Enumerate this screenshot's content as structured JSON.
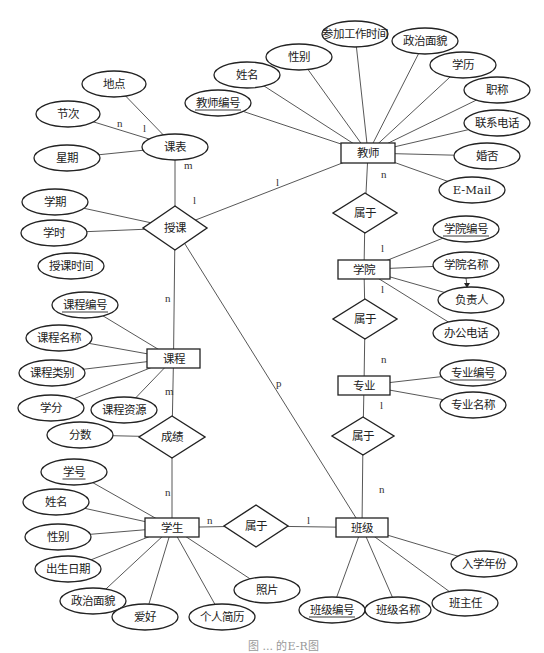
{
  "diagram": {
    "type": "E-R diagram",
    "caption": "图 ... 的E-R图",
    "entities": [
      {
        "id": "teacher",
        "label": "教师",
        "x": 341,
        "y": 143,
        "w": 54,
        "h": 20
      },
      {
        "id": "college",
        "label": "学院",
        "x": 338,
        "y": 260,
        "w": 52,
        "h": 19
      },
      {
        "id": "major",
        "label": "专业",
        "x": 338,
        "y": 376,
        "w": 52,
        "h": 19
      },
      {
        "id": "class",
        "label": "班级",
        "x": 336,
        "y": 518,
        "w": 52,
        "h": 19
      },
      {
        "id": "student",
        "label": "学生",
        "x": 145,
        "y": 518,
        "w": 54,
        "h": 19
      },
      {
        "id": "course",
        "label": "课程",
        "x": 147,
        "y": 349,
        "w": 53,
        "h": 19
      },
      {
        "id": "timetable",
        "label": "课表",
        "x": 175,
        "y": 147,
        "type": "ellipse",
        "rx": 33,
        "ry": 13
      }
    ],
    "relationships": [
      {
        "id": "teach",
        "label": "授课",
        "cx": 175,
        "cy": 228,
        "hw": 32,
        "hh": 22
      },
      {
        "id": "belong1",
        "label": "属于",
        "cx": 365,
        "cy": 213,
        "hw": 32,
        "hh": 20
      },
      {
        "id": "belong2",
        "label": "属于",
        "cx": 365,
        "cy": 319,
        "hw": 32,
        "hh": 20
      },
      {
        "id": "belong3",
        "label": "属于",
        "cx": 363,
        "cy": 436,
        "hw": 31,
        "hh": 19
      },
      {
        "id": "belong4",
        "label": "属于",
        "cx": 256,
        "cy": 526,
        "hw": 32,
        "hh": 21
      },
      {
        "id": "grade",
        "label": "成绩",
        "cx": 172,
        "cy": 437,
        "hw": 33,
        "hh": 21
      }
    ],
    "attributes": [
      {
        "label": "地点",
        "cx": 114,
        "cy": 84,
        "rx": 32,
        "ry": 13,
        "of": "timetable",
        "key": false
      },
      {
        "label": "节次",
        "cx": 68,
        "cy": 114,
        "rx": 32,
        "ry": 13,
        "of": "timetable",
        "key": false
      },
      {
        "label": "星期",
        "cx": 67,
        "cy": 158,
        "rx": 33,
        "ry": 13,
        "of": "timetable",
        "key": false
      },
      {
        "label": "学期",
        "cx": 55,
        "cy": 202,
        "rx": 33,
        "ry": 13,
        "of": "teach",
        "key": false
      },
      {
        "label": "学时",
        "cx": 54,
        "cy": 233,
        "rx": 33,
        "ry": 13,
        "of": "teach",
        "key": false
      },
      {
        "label": "授课时间",
        "cx": 71,
        "cy": 266,
        "rx": 33,
        "ry": 13,
        "of": null,
        "key": false
      },
      {
        "label": "课程编号",
        "cx": 85,
        "cy": 305,
        "rx": 33,
        "ry": 13,
        "of": "course",
        "key": true
      },
      {
        "label": "课程名称",
        "cx": 59,
        "cy": 338,
        "rx": 33,
        "ry": 13,
        "of": "course",
        "key": false
      },
      {
        "label": "课程类别",
        "cx": 52,
        "cy": 373,
        "rx": 33,
        "ry": 13,
        "of": "course",
        "key": false
      },
      {
        "label": "学分",
        "cx": 51,
        "cy": 408,
        "rx": 33,
        "ry": 13,
        "of": "course",
        "key": false
      },
      {
        "label": "课程资源",
        "cx": 124,
        "cy": 410,
        "rx": 33,
        "ry": 13,
        "of": "course",
        "key": false
      },
      {
        "label": "分数",
        "cx": 80,
        "cy": 435,
        "rx": 33,
        "ry": 13,
        "of": "grade",
        "key": false
      },
      {
        "label": "学号",
        "cx": 74,
        "cy": 472,
        "rx": 33,
        "ry": 13,
        "of": "student",
        "key": true
      },
      {
        "label": "姓名",
        "cx": 56,
        "cy": 502,
        "rx": 33,
        "ry": 13,
        "of": "student",
        "key": false
      },
      {
        "label": "性别",
        "cx": 58,
        "cy": 537,
        "rx": 33,
        "ry": 13,
        "of": "student",
        "key": false
      },
      {
        "label": "出生日期",
        "cx": 68,
        "cy": 569,
        "rx": 33,
        "ry": 13,
        "of": "student",
        "key": false
      },
      {
        "label": "政治面貌",
        "cx": 93,
        "cy": 601,
        "rx": 33,
        "ry": 13,
        "of": "student",
        "key": false
      },
      {
        "label": "爱好",
        "cx": 145,
        "cy": 617,
        "rx": 33,
        "ry": 13,
        "of": "student",
        "key": false
      },
      {
        "label": "个人简历",
        "cx": 222,
        "cy": 617,
        "rx": 33,
        "ry": 13,
        "of": "student",
        "key": false
      },
      {
        "label": "照片",
        "cx": 267,
        "cy": 590,
        "rx": 33,
        "ry": 13,
        "of": "student",
        "key": false
      },
      {
        "label": "班级编号",
        "cx": 332,
        "cy": 610,
        "rx": 33,
        "ry": 13,
        "of": "class",
        "key": true
      },
      {
        "label": "班级名称",
        "cx": 398,
        "cy": 610,
        "rx": 33,
        "ry": 13,
        "of": "class",
        "key": false
      },
      {
        "label": "班主任",
        "cx": 465,
        "cy": 603,
        "rx": 33,
        "ry": 13,
        "of": "class",
        "key": false
      },
      {
        "label": "入学年份",
        "cx": 484,
        "cy": 564,
        "rx": 33,
        "ry": 13,
        "of": "class",
        "key": false
      },
      {
        "label": "专业编号",
        "cx": 473,
        "cy": 373,
        "rx": 33,
        "ry": 13,
        "of": "major",
        "key": true
      },
      {
        "label": "专业名称",
        "cx": 473,
        "cy": 405,
        "rx": 33,
        "ry": 13,
        "of": "major",
        "key": false
      },
      {
        "label": "学院编号",
        "cx": 466,
        "cy": 229,
        "rx": 33,
        "ry": 13,
        "of": "college",
        "key": true
      },
      {
        "label": "学院名称",
        "cx": 466,
        "cy": 265,
        "rx": 33,
        "ry": 13,
        "of": "college",
        "key": false
      },
      {
        "label": "负责人",
        "cx": 471,
        "cy": 300,
        "rx": 33,
        "ry": 13,
        "of": "college",
        "key": false
      },
      {
        "label": "办公电话",
        "cx": 466,
        "cy": 333,
        "rx": 33,
        "ry": 13,
        "of": "college",
        "key": false
      },
      {
        "label": "姓名",
        "cx": 247,
        "cy": 75,
        "rx": 33,
        "ry": 13,
        "of": "teacher",
        "key": false
      },
      {
        "label": "教师编号",
        "cx": 218,
        "cy": 103,
        "rx": 33,
        "ry": 13,
        "of": "teacher",
        "key": true
      },
      {
        "label": "性别",
        "cx": 299,
        "cy": 57,
        "rx": 33,
        "ry": 13,
        "of": "teacher",
        "key": false
      },
      {
        "label": "参加工作时间",
        "cx": 355,
        "cy": 34,
        "rx": 33,
        "ry": 13,
        "of": "teacher",
        "key": false
      },
      {
        "label": "政治面貌",
        "cx": 425,
        "cy": 41,
        "rx": 33,
        "ry": 13,
        "of": "teacher",
        "key": false
      },
      {
        "label": "学历",
        "cx": 463,
        "cy": 65,
        "rx": 33,
        "ry": 13,
        "of": "teacher",
        "key": false
      },
      {
        "label": "职称",
        "cx": 497,
        "cy": 90,
        "rx": 33,
        "ry": 13,
        "of": "teacher",
        "key": false
      },
      {
        "label": "联系电话",
        "cx": 497,
        "cy": 123,
        "rx": 33,
        "ry": 13,
        "of": "teacher",
        "key": false
      },
      {
        "label": "婚否",
        "cx": 487,
        "cy": 156,
        "rx": 33,
        "ry": 13,
        "of": "teacher",
        "key": false
      },
      {
        "label": "E-Mail",
        "cx": 472,
        "cy": 190,
        "rx": 33,
        "ry": 13,
        "of": "teacher",
        "key": false
      }
    ],
    "cardinalities": [
      {
        "label": "n",
        "x": 117,
        "y": 127
      },
      {
        "label": "l",
        "x": 143,
        "y": 132
      },
      {
        "label": "m",
        "x": 184,
        "y": 169
      },
      {
        "label": "l",
        "x": 193,
        "y": 204
      },
      {
        "label": "l",
        "x": 276,
        "y": 186
      },
      {
        "label": "n",
        "x": 381,
        "y": 178
      },
      {
        "label": "l",
        "x": 381,
        "y": 252
      },
      {
        "label": "l",
        "x": 381,
        "y": 293
      },
      {
        "label": "n",
        "x": 381,
        "y": 363
      },
      {
        "label": "l",
        "x": 380,
        "y": 409
      },
      {
        "label": "n",
        "x": 379,
        "y": 493
      },
      {
        "label": "p",
        "x": 276,
        "y": 387
      },
      {
        "label": "n",
        "x": 165,
        "y": 302
      },
      {
        "label": "m",
        "x": 165,
        "y": 395
      },
      {
        "label": "n",
        "x": 165,
        "y": 496
      },
      {
        "label": "n",
        "x": 207,
        "y": 524
      },
      {
        "label": "l",
        "x": 307,
        "y": 524
      }
    ]
  }
}
